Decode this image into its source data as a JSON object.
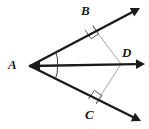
{
  "figure": {
    "background_color": "#ffffff",
    "width": 149,
    "height": 129,
    "ray_color": "#1a1a1a",
    "segment_color": "#b4b4b4",
    "arc_color": "#3c3c3c",
    "label_color": "#1a1a1a"
  },
  "labels": {
    "A": "A",
    "B": "B",
    "C": "C",
    "D": "D"
  },
  "points": {
    "A": {
      "x": 30,
      "y": 66
    },
    "B": {
      "x": 93,
      "y": 27
    },
    "C": {
      "x": 96,
      "y": 103
    },
    "D": {
      "x": 121,
      "y": 64
    }
  },
  "rays": [
    {
      "name": "ray-AB",
      "from": "A",
      "through": "B",
      "arrow_tip": {
        "x": 140,
        "y": 8
      },
      "has_arrowhead": true
    },
    {
      "name": "ray-AD",
      "from": "A",
      "through": "D",
      "arrow_tip": {
        "x": 145,
        "y": 64
      },
      "has_arrowhead": true,
      "is_bisector": true
    },
    {
      "name": "ray-AC",
      "from": "A",
      "through": "C",
      "arrow_tip": {
        "x": 141,
        "y": 121
      },
      "has_arrowhead": true
    }
  ],
  "segments": [
    {
      "name": "segment-BD",
      "from": "B",
      "to": "D",
      "style": "thin-gray"
    },
    {
      "name": "segment-CD",
      "from": "C",
      "to": "D",
      "style": "thin-gray"
    }
  ],
  "right_angles": [
    {
      "name": "right-angle-at-B",
      "at": "B",
      "between": [
        "ray-AB",
        "segment-BD"
      ]
    },
    {
      "name": "right-angle-at-C",
      "at": "C",
      "between": [
        "ray-AC",
        "segment-CD"
      ]
    }
  ],
  "angle_marks": {
    "name": "angle-bisector-ticks-at-A",
    "at": "A",
    "arc_count": 2,
    "meaning": "congruent angles BAD and DAC"
  }
}
